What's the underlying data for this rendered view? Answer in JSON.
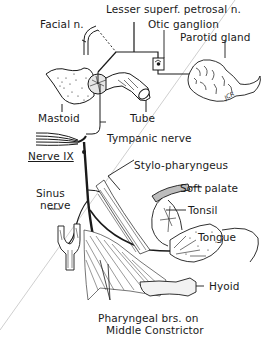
{
  "figure": {
    "labels": {
      "facial_n": "Facial n.",
      "lesser_superf_petrosal_n": "Lesser superf. petrosal n.",
      "otic_ganglion": "Otic ganglion",
      "parotid_gland": "Parotid gland",
      "mastoid": "Mastoid",
      "tube": "Tube",
      "tympanic_nerve": "Tympanic nerve",
      "nerve_ix": "Nerve IX",
      "stylo_pharyngeus": "Stylo-pharyngeus",
      "soft_palate": "Soft palate",
      "tonsil": "Tonsil",
      "sinus": "Sinus",
      "nerve": "nerve",
      "tongue": "Tongue",
      "hyoid": "Hyoid",
      "pharyngeal_brs_line1": "Pharyngeal brs. on",
      "pharyngeal_brs_line2": "Middle Constrictor"
    },
    "signature": "JCR",
    "colors": {
      "ink": "#1a1a1a",
      "background": "#ffffff",
      "fold_line": "#c8c8c8"
    }
  }
}
